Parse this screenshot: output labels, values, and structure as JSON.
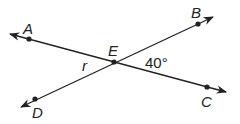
{
  "diagram": {
    "points": {
      "A": {
        "label": "A"
      },
      "B": {
        "label": "B"
      },
      "C": {
        "label": "C"
      },
      "D": {
        "label": "D"
      },
      "E": {
        "label": "E"
      }
    },
    "angles": {
      "r": {
        "label": "r"
      },
      "BEC": {
        "label": "40°"
      }
    },
    "colors": {
      "line": "#222222",
      "background": "#ffffff"
    }
  }
}
